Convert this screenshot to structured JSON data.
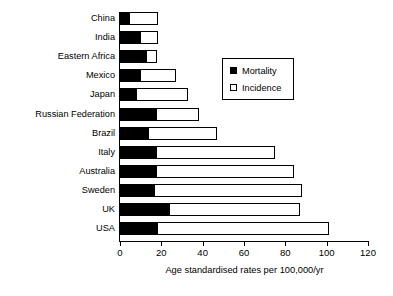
{
  "chart_data": {
    "type": "bar",
    "orientation": "horizontal",
    "stacked": false,
    "title": "",
    "xlabel": "Age standardised rates per 100,000/yr",
    "ylabel": "",
    "xlim": [
      0,
      120
    ],
    "xticks": [
      0,
      20,
      40,
      60,
      80,
      100,
      120
    ],
    "xtick_labels": [
      "0",
      "20",
      "40",
      "60",
      "80",
      "100",
      "120"
    ],
    "grid": false,
    "legend_position": "upper center",
    "categories": [
      "China",
      "India",
      "Eastern Africa",
      "Mexico",
      "Japan",
      "Russian Federation",
      "Brazil",
      "Italy",
      "Australia",
      "Sweden",
      "UK",
      "USA"
    ],
    "series": [
      {
        "name": "Mortality",
        "color": "#000000",
        "values": [
          5,
          10,
          13,
          10,
          8,
          18,
          14,
          18,
          18,
          17,
          24,
          18.5
        ]
      },
      {
        "name": "Incidence",
        "color": "#ffffff",
        "values": [
          18.5,
          18.5,
          18,
          27,
          33,
          38,
          47,
          75,
          84,
          88,
          87,
          101
        ]
      }
    ]
  },
  "axis": {
    "xlabel": "Age standardised rates per 100,000/yr"
  },
  "legend": {
    "items": [
      {
        "label": "Mortality",
        "style": "filled"
      },
      {
        "label": "Incidence",
        "style": "hollow"
      }
    ]
  }
}
